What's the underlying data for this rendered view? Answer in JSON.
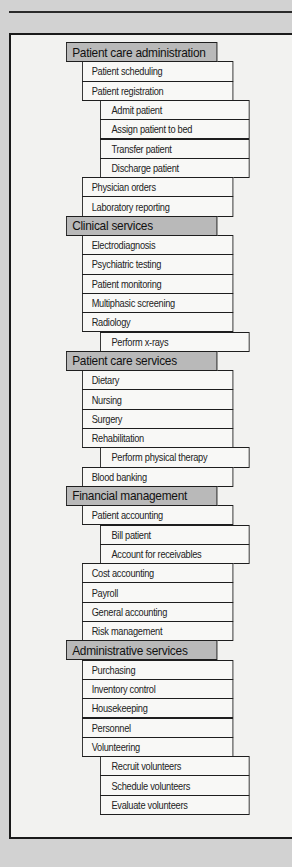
{
  "colors": {
    "page_background": "#d2d2d2",
    "frame_fill": "#f2f2f0",
    "header_fill": "#b9b9b9",
    "item_fill": "#f8f8f6",
    "line": "#1e1e1e"
  },
  "sections": [
    {
      "label": "Patient care administration",
      "items": [
        {
          "label": "Patient scheduling",
          "level": 1
        },
        {
          "label": "Patient registration",
          "level": 1
        },
        {
          "label": "Admit patient",
          "level": 2
        },
        {
          "label": "Assign patient to bed",
          "level": 2
        },
        {
          "label": "Transfer patient",
          "level": 2
        },
        {
          "label": "Discharge patient",
          "level": 2
        },
        {
          "label": "Physician orders",
          "level": 1
        },
        {
          "label": "Laboratory reporting",
          "level": 1
        }
      ]
    },
    {
      "label": "Clinical services",
      "items": [
        {
          "label": "Electrodiagnosis",
          "level": 1
        },
        {
          "label": "Psychiatric testing",
          "level": 1
        },
        {
          "label": "Patient monitoring",
          "level": 1
        },
        {
          "label": "Multiphasic screening",
          "level": 1
        },
        {
          "label": "Radiology",
          "level": 1
        },
        {
          "label": "Perform x-rays",
          "level": 2
        }
      ]
    },
    {
      "label": "Patient care services",
      "items": [
        {
          "label": "Dietary",
          "level": 1
        },
        {
          "label": "Nursing",
          "level": 1
        },
        {
          "label": "Surgery",
          "level": 1
        },
        {
          "label": "Rehabilitation",
          "level": 1
        },
        {
          "label": "Perform physical therapy",
          "level": 2
        },
        {
          "label": "Blood banking",
          "level": 1
        }
      ]
    },
    {
      "label": "Financial management",
      "items": [
        {
          "label": "Patient accounting",
          "level": 1
        },
        {
          "label": "Bill patient",
          "level": 2
        },
        {
          "label": "Account for receivables",
          "level": 2
        },
        {
          "label": "Cost accounting",
          "level": 1
        },
        {
          "label": "Payroll",
          "level": 1
        },
        {
          "label": "General accounting",
          "level": 1
        },
        {
          "label": "Risk management",
          "level": 1
        }
      ]
    },
    {
      "label": "Administrative services",
      "items": [
        {
          "label": "Purchasing",
          "level": 1
        },
        {
          "label": "Inventory control",
          "level": 1
        },
        {
          "label": "Housekeeping",
          "level": 1
        },
        {
          "label": "Personnel",
          "level": 1
        },
        {
          "label": "Volunteering",
          "level": 1
        },
        {
          "label": "Recruit volunteers",
          "level": 2
        },
        {
          "label": "Schedule volunteers",
          "level": 2
        },
        {
          "label": "Evaluate volunteers",
          "level": 2
        }
      ]
    }
  ]
}
